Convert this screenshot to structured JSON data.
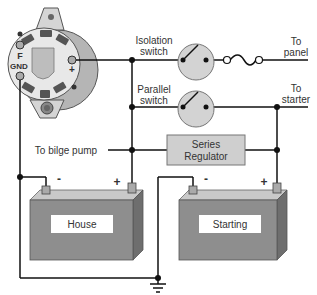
{
  "diagram": {
    "type": "wiring-schematic",
    "alternator": {
      "terminals": [
        "F",
        "GND",
        "+"
      ]
    },
    "switches": [
      {
        "label_line1": "Isolation",
        "label_line2": "switch"
      },
      {
        "label_line1": "Parallel",
        "label_line2": "switch"
      }
    ],
    "outputs": [
      {
        "line1": "To",
        "line2": "panel"
      },
      {
        "line1": "To",
        "line2": "starter"
      }
    ],
    "bilge_label": "To bilge pump",
    "regulator": {
      "line1": "Series",
      "line2": "Regulator"
    },
    "batteries": [
      {
        "label": "House",
        "neg": "-",
        "pos": "+"
      },
      {
        "label": "Starting",
        "neg": "-",
        "pos": "+"
      }
    ],
    "ground_symbol": "ground",
    "colors": {
      "wire": "#111111",
      "fill_gray": "#c8c8c8",
      "battery_front": "#8e8e8e",
      "battery_top": "#c9c9c9",
      "battery_side": "#6e6e6e",
      "regulator_fill": "#cfcfcf",
      "label_bg": "#ffffff"
    }
  }
}
